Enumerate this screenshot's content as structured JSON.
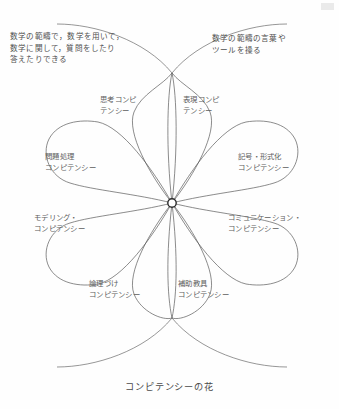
{
  "figure": {
    "caption": "コンピテンシーの花",
    "center_marker": "center-node",
    "line_color": "#5a5a5a",
    "text_color": "#5d5d5d",
    "background_color": "#fefefe"
  },
  "annotations": [
    {
      "name": "ask-and-answer-in-mathematics",
      "position": "top-left",
      "lines": [
        "数学の範疇で，数学を用いて，",
        "数学に関して，質問をしたり",
        "答えたりできる"
      ]
    },
    {
      "name": "handle-mathematical-language-and-tools",
      "position": "top-right",
      "lines": [
        "数学の範疇の言葉や",
        "ツールを操る"
      ]
    }
  ],
  "petals": [
    {
      "id": "thinking",
      "lines": [
        "思考コンピ",
        "テンシー"
      ]
    },
    {
      "id": "representation",
      "lines": [
        "表現コンピ",
        "テンシー"
      ]
    },
    {
      "id": "problem-handling",
      "lines": [
        "問題処理",
        "コンピテンシー"
      ]
    },
    {
      "id": "symbol-formalism",
      "lines": [
        "記号・形式化",
        "コンピテンシー"
      ]
    },
    {
      "id": "modelling",
      "lines": [
        "モデリング・",
        "コンピテンシー"
      ]
    },
    {
      "id": "communication",
      "lines": [
        "コミュニケーション・",
        "コンピテンシー"
      ]
    },
    {
      "id": "reasoning",
      "lines": [
        "論理づけ",
        "コンピテンシー"
      ]
    },
    {
      "id": "aids-and-tools",
      "lines": [
        "補助教具",
        "コンピテンシー"
      ]
    }
  ]
}
